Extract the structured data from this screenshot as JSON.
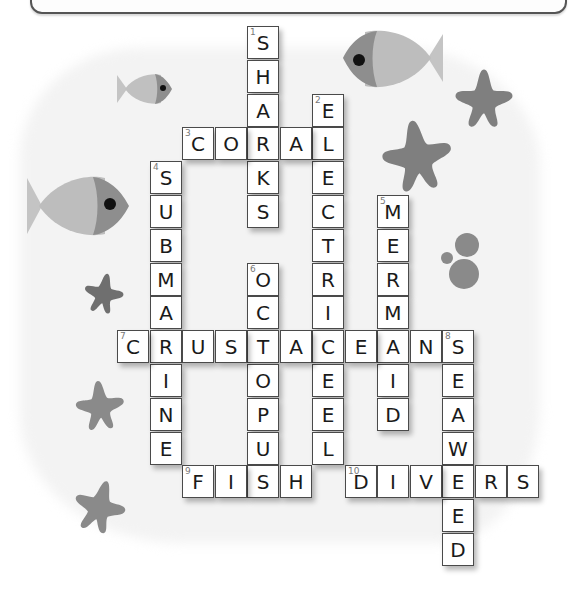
{
  "puzzle": {
    "title": "",
    "theme": "ocean crossword",
    "cell_size": [
      32.5,
      33.8
    ],
    "origin": [
      117,
      26
    ],
    "words": [
      {
        "number": 1,
        "direction": "down",
        "answer": "SHARKS",
        "col": 4,
        "row": 0
      },
      {
        "number": 2,
        "direction": "down",
        "answer": "ELECTRICEEL",
        "col": 6,
        "row": 2
      },
      {
        "number": 3,
        "direction": "across",
        "answer": "CORAL",
        "col": 2,
        "row": 3
      },
      {
        "number": 4,
        "direction": "down",
        "answer": "SUBMARINE",
        "col": 1,
        "row": 4
      },
      {
        "number": 5,
        "direction": "down",
        "answer": "MERMAID",
        "col": 8,
        "row": 5
      },
      {
        "number": 6,
        "direction": "down",
        "answer": "OCTOPUS",
        "col": 4,
        "row": 7
      },
      {
        "number": 7,
        "direction": "across",
        "answer": "CRUSTACEANS",
        "col": 0,
        "row": 9
      },
      {
        "number": 8,
        "direction": "down",
        "answer": "SEAWEED",
        "col": 10,
        "row": 9
      },
      {
        "number": 9,
        "direction": "across",
        "answer": "FISH",
        "col": 2,
        "row": 13
      },
      {
        "number": 10,
        "direction": "across",
        "answer": "DIVERS",
        "col": 7,
        "row": 13
      }
    ]
  },
  "decorations": {
    "fish": [
      {
        "name": "small-fish-top-left",
        "x": 117,
        "y": 73,
        "w": 55,
        "h": 32,
        "facing": "right"
      },
      {
        "name": "large-fish-left",
        "x": 27,
        "y": 176,
        "w": 102,
        "h": 60,
        "facing": "right"
      },
      {
        "name": "fish-top-right",
        "x": 343,
        "y": 30,
        "w": 100,
        "h": 58,
        "facing": "left"
      }
    ],
    "starfish": [
      {
        "name": "starfish-top-right",
        "x": 454,
        "y": 68,
        "size": 60
      },
      {
        "name": "starfish-center-right",
        "x": 384,
        "y": 122,
        "size": 70
      },
      {
        "name": "starfish-left-1",
        "x": 84,
        "y": 275,
        "size": 40
      },
      {
        "name": "starfish-left-2",
        "x": 76,
        "y": 380,
        "size": 50
      },
      {
        "name": "starfish-left-3",
        "x": 74,
        "y": 481,
        "size": 52
      }
    ],
    "bubbles": [
      {
        "cx": 467,
        "cy": 245,
        "r": 12
      },
      {
        "cx": 447,
        "cy": 258,
        "r": 6
      },
      {
        "cx": 464,
        "cy": 274,
        "r": 15
      }
    ],
    "colors": {
      "fish_body": "#b9b9b9",
      "fish_head": "#8e8e8e",
      "fish_eye": "#111111",
      "starfish": "#7f7f7f",
      "bubble": "#888888",
      "background_blob": "#f3f3f3",
      "cell_border": "#4a4a4a",
      "letter": "#1a1a1a",
      "clue_number": "#777777"
    }
  }
}
